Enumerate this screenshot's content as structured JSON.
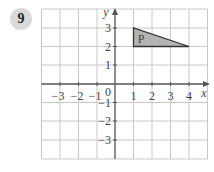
{
  "question": {
    "number": "9"
  },
  "graph": {
    "x_axis_label": "x",
    "y_axis_label": "y",
    "origin_label": "0",
    "x_tick_labels": [
      "−3",
      "−2",
      "−1",
      "1",
      "2",
      "3",
      "4"
    ],
    "y_tick_labels": [
      "3",
      "2",
      "1",
      "−1",
      "−2",
      "−3"
    ],
    "x_range": [
      -4,
      5
    ],
    "y_range": [
      -4,
      4
    ],
    "shape": {
      "label": "P",
      "vertices": [
        [
          1,
          2
        ],
        [
          1,
          3
        ],
        [
          4,
          2
        ]
      ],
      "fill_color": "#b3b3b3",
      "stroke_color": "#333333"
    },
    "grid_color": "#c8c8c8",
    "axis_color": "#555555"
  }
}
